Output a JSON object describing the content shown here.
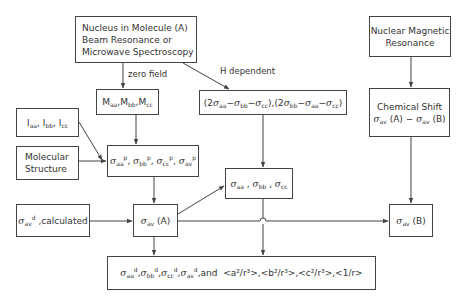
{
  "diagram": {
    "nodes": {
      "source_mbr": {
        "lines": [
          "Nucleus in Molecule (A)",
          "Beam Resonance or",
          "Microwave Spectroscopy"
        ]
      },
      "source_nmr": {
        "lines": [
          "Nuclear Magnetic",
          "Resonance"
        ]
      },
      "spin_rotation": {
        "text": "Maa,Mbb,Mcc",
        "symbol": "M",
        "subscripts": [
          "aa",
          "bb",
          "cc"
        ]
      },
      "anisotropy": {
        "text": "(2σaa−σbb−σcc),(2σbb−σaa−σcc)"
      },
      "moments_inertia": {
        "text": "Iaa, Ibb, Icc",
        "symbol": "I",
        "subscripts": [
          "aa",
          "bb",
          "cc"
        ]
      },
      "molecular_structure": {
        "lines": [
          "Molecular",
          "Structure"
        ]
      },
      "paramagnetic": {
        "text": "σaa^p, σbb^p, σcc^p, σav^p",
        "superscript": "p",
        "subscripts": [
          "aa",
          "bb",
          "cc",
          "av"
        ]
      },
      "diamagnetic_calc": {
        "text": "σav^d ,calculated",
        "suffix": ",calculated"
      },
      "sigma_av_a": {
        "text": "σav (A)",
        "suffix": "(A)"
      },
      "sigma_tensor": {
        "text": "σaa , σbb , σcc"
      },
      "chemical_shift": {
        "lines": [
          "Chemical Shift",
          "σav (A) − σav (B)"
        ],
        "title": "Chemical Shift"
      },
      "sigma_av_b": {
        "text": "σav (B)",
        "suffix": "(B)"
      },
      "result": {
        "text": "σaa^d,σbb^d,σcc^d,σav^d,and <a²/r³>,<b²/r³>,<c²/r³>,<1/r>",
        "and_label": ",and",
        "expectations": [
          "<a²/r³>",
          "<b²/r³>",
          "<c²/r³>",
          "<1/r>"
        ]
      }
    },
    "edge_labels": {
      "zero_field": "zero field",
      "h_dependent": "H dependent"
    },
    "colors": {
      "line": "#444444",
      "text": "#333333",
      "background": "#ffffff"
    }
  }
}
